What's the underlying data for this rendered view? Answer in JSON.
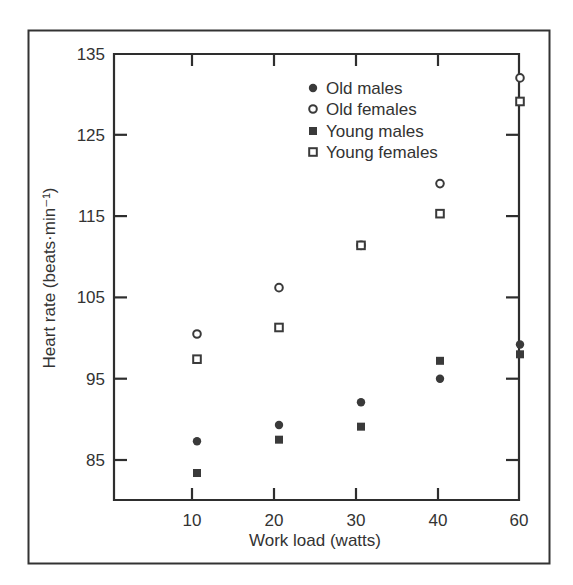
{
  "chart_data": {
    "type": "scatter",
    "title": "",
    "xlabel": "Work load (watts)",
    "ylabel": "Heart rate (beats·min⁻¹)",
    "categories": [
      "10",
      "20",
      "30",
      "40",
      "60"
    ],
    "x": [
      10,
      20,
      30,
      40,
      60
    ],
    "ylim": [
      80,
      135
    ],
    "yticks": [
      85,
      95,
      105,
      115,
      125,
      135
    ],
    "grid": false,
    "legend_position": "upper-right-inside",
    "series": [
      {
        "name": "Old males",
        "marker": "filled-circle",
        "values": [
          87.3,
          89.3,
          92.1,
          95.0,
          99.2
        ]
      },
      {
        "name": "Old females",
        "marker": "open-circle",
        "values": [
          100.5,
          106.2,
          111.4,
          119.0,
          132.0
        ]
      },
      {
        "name": "Young males",
        "marker": "filled-square",
        "values": [
          83.4,
          87.5,
          89.1,
          97.2,
          98.0
        ]
      },
      {
        "name": "Young females",
        "marker": "open-square",
        "values": [
          97.4,
          101.3,
          111.4,
          115.3,
          129.1
        ]
      }
    ]
  },
  "style": {
    "ink_color": "#333333",
    "marker_color": "#3a3a3a",
    "background": "#ffffff"
  }
}
